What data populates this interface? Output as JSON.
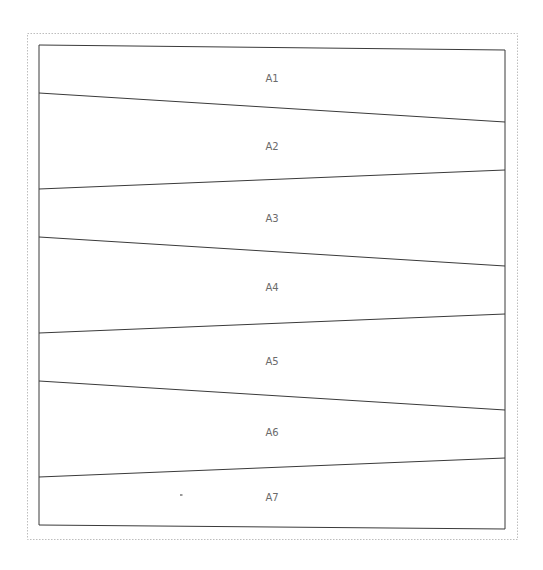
{
  "diagram": {
    "outer_frame": {
      "x1": 27,
      "y1": 33,
      "x2": 517,
      "y2": 539,
      "style": "dotted",
      "color": "#bdbdbd"
    },
    "panel": {
      "top": {
        "left_y": 45,
        "right_y": 50
      },
      "bottom": {
        "left_y": 525,
        "right_y": 529
      },
      "left_x": 39,
      "right_x": 505,
      "color": "#3a3a3a"
    },
    "dividers": [
      {
        "left_y": 93,
        "right_y": 122
      },
      {
        "left_y": 189,
        "right_y": 170
      },
      {
        "left_y": 237,
        "right_y": 266
      },
      {
        "left_y": 333,
        "right_y": 314
      },
      {
        "left_y": 381,
        "right_y": 410
      },
      {
        "left_y": 477,
        "right_y": 458
      }
    ],
    "regions": [
      {
        "label": "A1",
        "x": 272,
        "y": 82
      },
      {
        "label": "A2",
        "x": 272,
        "y": 150
      },
      {
        "label": "A3",
        "x": 272,
        "y": 222
      },
      {
        "label": "A4",
        "x": 272,
        "y": 291
      },
      {
        "label": "A5",
        "x": 272,
        "y": 365
      },
      {
        "label": "A6",
        "x": 272,
        "y": 436
      },
      {
        "label": "A7",
        "x": 272,
        "y": 501
      }
    ],
    "mark": {
      "x": 181,
      "y": 495,
      "text": "-"
    }
  }
}
